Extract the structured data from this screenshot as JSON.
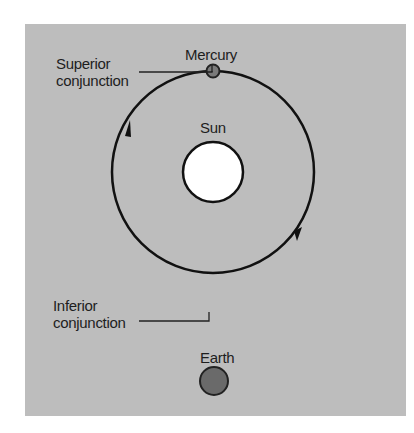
{
  "labels": {
    "superior": [
      "Superior",
      "conjunction"
    ],
    "mercury": "Mercury",
    "sun": "Sun",
    "inferior": [
      "Inferior",
      "conjunction"
    ],
    "earth": "Earth"
  },
  "colors": {
    "background": "#bdbdbd",
    "orbit": "#111111",
    "sun_fill": "#ffffff",
    "mercury_fill": "#7a7a7a",
    "earth_fill": "#6a6a6a"
  }
}
